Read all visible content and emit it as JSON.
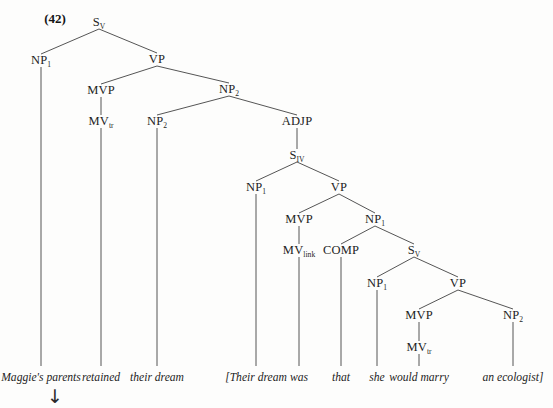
{
  "figure": {
    "example_number": "(42)",
    "example_number_pos": {
      "x": 55,
      "y": 19
    },
    "arrow": {
      "glyph": "↓",
      "name": "downward-arrow",
      "x": 55,
      "y": 396
    },
    "stroke_color": "#555555",
    "text_color": "#1e1e1e",
    "background": "#fdfdfc"
  },
  "nodes": [
    {
      "id": "s1",
      "label": "S",
      "sub": "V",
      "x": 99,
      "y": 22
    },
    {
      "id": "np1a",
      "label": "NP",
      "sub": "1",
      "x": 41,
      "y": 60
    },
    {
      "id": "vp1",
      "label": "VP",
      "sub": "",
      "x": 157,
      "y": 59
    },
    {
      "id": "mvp1",
      "label": "MVP",
      "sub": "",
      "x": 101,
      "y": 90
    },
    {
      "id": "np2a",
      "label": "NP",
      "sub": "2",
      "x": 229,
      "y": 89
    },
    {
      "id": "mvtr1",
      "label": "MV",
      "sub": "tr",
      "x": 101,
      "y": 121
    },
    {
      "id": "np2b",
      "label": "NP",
      "sub": "2",
      "x": 157,
      "y": 121
    },
    {
      "id": "adjp",
      "label": "ADJP",
      "sub": "",
      "x": 297,
      "y": 121
    },
    {
      "id": "s2",
      "label": "S",
      "sub": "IV",
      "x": 297,
      "y": 155
    },
    {
      "id": "np1b",
      "label": "NP",
      "sub": "1",
      "x": 256,
      "y": 187
    },
    {
      "id": "vp2",
      "label": "VP",
      "sub": "",
      "x": 339,
      "y": 187
    },
    {
      "id": "mvp2",
      "label": "MVP",
      "sub": "",
      "x": 299,
      "y": 219
    },
    {
      "id": "np1c",
      "label": "NP",
      "sub": "1",
      "x": 375,
      "y": 219
    },
    {
      "id": "mvlink",
      "label": "MV",
      "sub": "link",
      "x": 299,
      "y": 250
    },
    {
      "id": "comp",
      "label": "COMP",
      "sub": "",
      "x": 341,
      "y": 250
    },
    {
      "id": "s3",
      "label": "S",
      "sub": "V",
      "x": 414,
      "y": 250
    },
    {
      "id": "np1d",
      "label": "NP",
      "sub": "1",
      "x": 377,
      "y": 283
    },
    {
      "id": "vp3",
      "label": "VP",
      "sub": "",
      "x": 458,
      "y": 283
    },
    {
      "id": "mvp3",
      "label": "MVP",
      "sub": "",
      "x": 419,
      "y": 315
    },
    {
      "id": "np2c",
      "label": "NP",
      "sub": "2",
      "x": 513,
      "y": 315
    },
    {
      "id": "mvtr2",
      "label": "MV",
      "sub": "tr",
      "x": 419,
      "y": 347
    }
  ],
  "edges": [
    {
      "from": "s1",
      "to": "np1a",
      "name": "edge-s1-np1"
    },
    {
      "from": "s1",
      "to": "vp1",
      "name": "edge-s1-vp"
    },
    {
      "from": "vp1",
      "to": "mvp1",
      "name": "edge-vp-mvp"
    },
    {
      "from": "vp1",
      "to": "np2a",
      "name": "edge-vp-np2"
    },
    {
      "from": "mvp1",
      "to": "mvtr1",
      "name": "edge-mvp-mvtr"
    },
    {
      "from": "np2a",
      "to": "np2b",
      "name": "edge-np2-np2"
    },
    {
      "from": "np2a",
      "to": "adjp",
      "name": "edge-np2-adjp"
    },
    {
      "from": "adjp",
      "to": "s2",
      "name": "edge-adjp-s2"
    },
    {
      "from": "s2",
      "to": "np1b",
      "name": "edge-s2-np1"
    },
    {
      "from": "s2",
      "to": "vp2",
      "name": "edge-s2-vp"
    },
    {
      "from": "vp2",
      "to": "mvp2",
      "name": "edge-vp2-mvp"
    },
    {
      "from": "vp2",
      "to": "np1c",
      "name": "edge-vp2-np1"
    },
    {
      "from": "mvp2",
      "to": "mvlink",
      "name": "edge-mvp2-mvlink"
    },
    {
      "from": "np1c",
      "to": "comp",
      "name": "edge-np1c-comp"
    },
    {
      "from": "np1c",
      "to": "s3",
      "name": "edge-np1c-s3"
    },
    {
      "from": "s3",
      "to": "np1d",
      "name": "edge-s3-np1"
    },
    {
      "from": "s3",
      "to": "vp3",
      "name": "edge-s3-vp"
    },
    {
      "from": "vp3",
      "to": "mvp3",
      "name": "edge-vp3-mvp"
    },
    {
      "from": "vp3",
      "to": "np2c",
      "name": "edge-vp3-np2"
    },
    {
      "from": "mvp3",
      "to": "mvtr2",
      "name": "edge-mvp3-mvtr"
    }
  ],
  "terminals": [
    {
      "id": "w1",
      "text": "Maggie's parents",
      "x": 41,
      "y": 378,
      "from": "np1a"
    },
    {
      "id": "w2",
      "text": "retained",
      "x": 101,
      "y": 378,
      "from": "mvtr1"
    },
    {
      "id": "w3",
      "text": "their dream",
      "x": 157,
      "y": 378,
      "from": "np2b"
    },
    {
      "id": "w4",
      "text": "[Their dream",
      "x": 256,
      "y": 378,
      "from": "np1b"
    },
    {
      "id": "w5",
      "text": "was",
      "x": 299,
      "y": 378,
      "from": "mvlink"
    },
    {
      "id": "w6",
      "text": "that",
      "x": 341,
      "y": 378,
      "from": "comp"
    },
    {
      "id": "w7",
      "text": "she",
      "x": 377,
      "y": 378,
      "from": "np1d"
    },
    {
      "id": "w8",
      "text": "would marry",
      "x": 419,
      "y": 378,
      "from": "mvtr2"
    },
    {
      "id": "w9",
      "text": "an ecologist]",
      "x": 513,
      "y": 378,
      "from": "np2c"
    }
  ]
}
